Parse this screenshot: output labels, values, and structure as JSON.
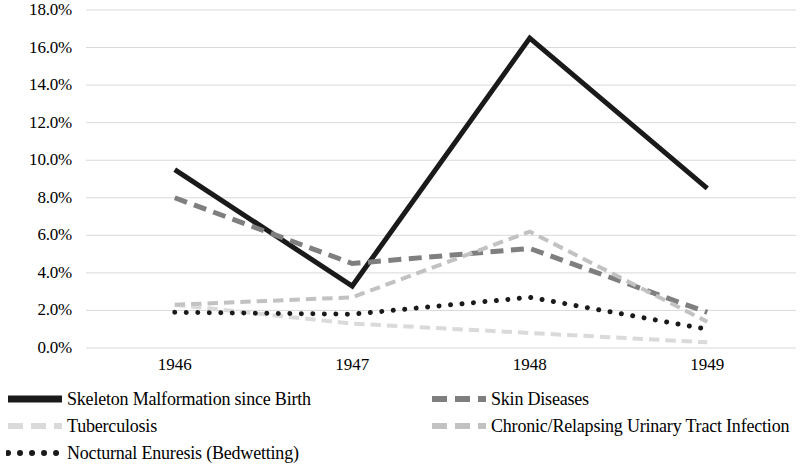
{
  "chart_data": {
    "type": "line",
    "title": "",
    "subtitle": "",
    "xlabel": "",
    "ylabel": "",
    "categories": [
      "1946",
      "1947",
      "1948",
      "1949"
    ],
    "x_tick_labels": [
      "1946",
      "1947",
      "1948",
      "1949"
    ],
    "y_tick_labels": [
      "0.0%",
      "2.0%",
      "4.0%",
      "6.0%",
      "8.0%",
      "10.0%",
      "12.0%",
      "14.0%",
      "16.0%",
      "18.0%"
    ],
    "y_tick_values": [
      0,
      2,
      4,
      6,
      8,
      10,
      12,
      14,
      16,
      18
    ],
    "ylim": [
      0,
      18
    ],
    "y_unit": "%",
    "grid": "horizontal",
    "legend_position": "bottom",
    "series": [
      {
        "name": "Skeleton Malformation since Birth",
        "values": [
          9.5,
          3.3,
          16.5,
          8.5
        ],
        "color": "#1a1a1a",
        "style": "solid",
        "width": 5
      },
      {
        "name": "Skin Diseases",
        "values": [
          8.0,
          4.5,
          5.3,
          1.9
        ],
        "color": "#7f7f7f",
        "style": "dashed",
        "width": 5
      },
      {
        "name": "Tuberculosis",
        "values": [
          2.3,
          1.3,
          0.8,
          0.3
        ],
        "color": "#dadada",
        "style": "dashed",
        "width": 4
      },
      {
        "name": "Chronic/Relapsing Urinary Tract Infection",
        "values": [
          2.3,
          2.7,
          6.2,
          1.4
        ],
        "color": "#c2c2c2",
        "style": "dashed",
        "width": 4
      },
      {
        "name": "Nocturnal Enuresis (Bedwetting)",
        "values": [
          1.9,
          1.8,
          2.7,
          1.0
        ],
        "color": "#1a1a1a",
        "style": "dotted",
        "width": 5
      }
    ]
  },
  "legend": {
    "items": [
      {
        "label": "Skeleton Malformation since Birth",
        "swatch": "solid-line-swatch",
        "color": "#1a1a1a"
      },
      {
        "label": "Skin Diseases",
        "swatch": "dashed-line-swatch",
        "color": "#7f7f7f"
      },
      {
        "label": "Tuberculosis",
        "swatch": "dashed-line-swatch",
        "color": "#dadada"
      },
      {
        "label": "Chronic/Relapsing Urinary Tract Infection",
        "swatch": "dashed-line-swatch",
        "color": "#c2c2c2"
      },
      {
        "label": "Nocturnal Enuresis (Bedwetting)",
        "swatch": "dotted-line-swatch",
        "color": "#1a1a1a"
      }
    ]
  },
  "colors": {
    "gridline": "#d9d9d9",
    "background": "#ffffff",
    "text": "#000000"
  }
}
